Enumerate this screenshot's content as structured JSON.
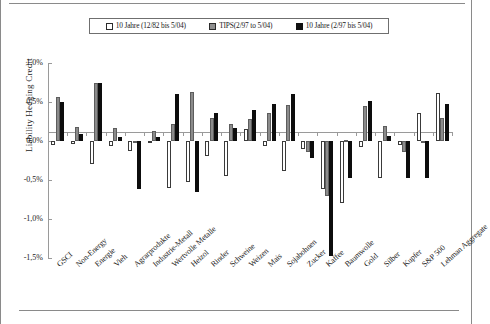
{
  "chart_data": {
    "type": "bar",
    "title": "",
    "xlabel": "",
    "ylabel": "Liability Hedging Credit",
    "ylim": [
      -1.5,
      1.0
    ],
    "ytick_labels": [
      "1,0%",
      "0,5%",
      "0,0%",
      "-0,5%",
      "-1,0%",
      "-1,5%"
    ],
    "ytick_values": [
      1.0,
      0.5,
      0.0,
      -0.5,
      -1.0,
      -1.5
    ],
    "grid": false,
    "legend_position": "top",
    "categories": [
      "GSCI",
      "Non-Energy",
      "Energie",
      "Vieh",
      "Agrarprodukte",
      "Industrie-Metall",
      "Wertvolle Metalle",
      "Heizol",
      "Rinder",
      "Schweine",
      "Weizen",
      "Mais",
      "Sojabohnen",
      "Zucker",
      "Kaffee",
      "Baumwolle",
      "Gold",
      "Silber",
      "Kupfer",
      "S&P 500",
      "Lehman Aggregate"
    ],
    "series": [
      {
        "name": "10 Jahre (12/82 bis 5/04)",
        "style": "white",
        "values": [
          -0.05,
          -0.04,
          -0.3,
          -0.06,
          -0.13,
          -0.03,
          -0.6,
          -0.52,
          -0.19,
          -0.45,
          0.16,
          -0.06,
          -0.38,
          -0.1,
          -0.62,
          -0.8,
          -0.08,
          -0.48,
          -0.05,
          0.36,
          0.62
        ]
      },
      {
        "name": "TIPS(2/97 to 5/04)",
        "style": "gray",
        "values": [
          0.57,
          0.18,
          0.75,
          0.17,
          -0.02,
          0.13,
          0.22,
          0.63,
          0.29,
          0.22,
          0.28,
          0.36,
          0.46,
          -0.14,
          -0.7,
          0.01,
          0.45,
          0.19,
          -0.14,
          -0.02,
          0.3
        ]
      },
      {
        "name": "10 Jahre (2/97 bis 5/04)",
        "style": "black",
        "values": [
          0.5,
          0.09,
          0.75,
          0.05,
          -0.62,
          0.05,
          0.6,
          -0.65,
          0.36,
          0.17,
          0.4,
          0.48,
          0.6,
          -0.22,
          -1.47,
          -0.47,
          0.51,
          0.07,
          -0.48,
          -0.47,
          0.48
        ]
      }
    ]
  },
  "legend": {
    "items": [
      {
        "label": "10 Jahre (12/82 bis 5/04)",
        "style": "white"
      },
      {
        "label": "TIPS(2/97 to 5/04)",
        "style": "gray"
      },
      {
        "label": "10 Jahre (2/97 bis 5/04)",
        "style": "black"
      }
    ]
  }
}
